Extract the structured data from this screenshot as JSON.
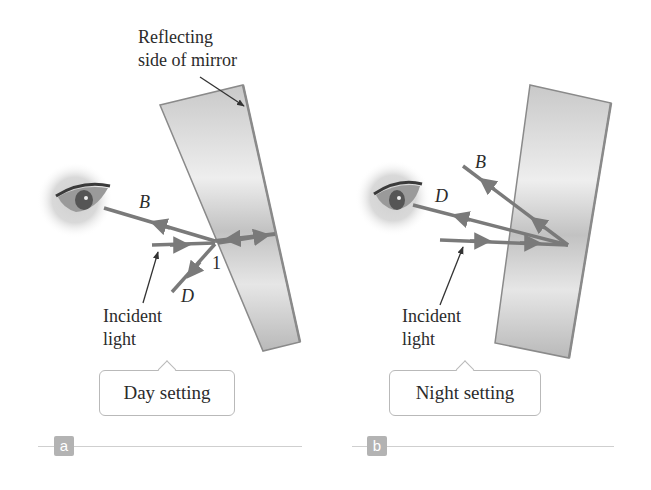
{
  "figure": {
    "panels": [
      {
        "id": "a",
        "badge": "a",
        "setting_label": "Day setting",
        "annotation_mirror": "Reflecting\nside of mirror",
        "annotation_mirror_line1": "Reflecting",
        "annotation_mirror_line2": "side of mirror",
        "incident_line1": "Incident",
        "incident_line2": "light",
        "ray_labels": {
          "B": "B",
          "D": "D",
          "point": "1"
        }
      },
      {
        "id": "b",
        "badge": "b",
        "setting_label": "Night setting",
        "incident_line1": "Incident",
        "incident_line2": "light",
        "ray_labels": {
          "B": "B",
          "D": "D"
        }
      }
    ],
    "colors": {
      "ray": "#7a7a7a",
      "mirror_fill_light": "#f2f2f2",
      "mirror_fill_dark": "#bdbdbd",
      "mirror_edge": "#8a8a8a",
      "badge": "#b3b3b3",
      "callout_border": "#b9b9b9"
    }
  }
}
